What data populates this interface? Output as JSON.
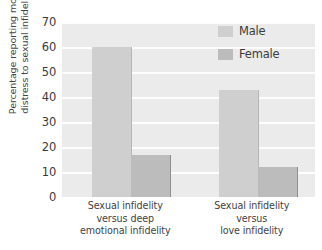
{
  "chart_data": {
    "type": "bar",
    "title": "",
    "xlabel": "",
    "ylabel": "Percentage reporting more\ndistress to sexual infidelity",
    "ylim": [
      0,
      70
    ],
    "ytick_step": 10,
    "yticks": [
      "70",
      "60",
      "50",
      "40",
      "30",
      "20",
      "10",
      "0"
    ],
    "grid": true,
    "grid_axis": "y",
    "legend_position": "top-right",
    "categories": [
      "Sexual infidelity\nversus deep\nemotional infidelity",
      "Sexual infidelity\nversus\nlove infidelity"
    ],
    "series": [
      {
        "name": "Male",
        "values": [
          60,
          43
        ],
        "color": "#cfcfcf"
      },
      {
        "name": "Female",
        "values": [
          17,
          12
        ],
        "color": "#bcbcbc"
      }
    ]
  },
  "legend": {
    "items": [
      {
        "label": "Male",
        "swatch": "male"
      },
      {
        "label": "Female",
        "swatch": "female"
      }
    ]
  },
  "colors": {
    "plot_background": "#ebebeb",
    "gridline": "#fdfdfd",
    "male_bar": "#cfcfcf",
    "female_bar": "#bcbcbc",
    "text": "#3b3b3b",
    "page_background": "#ffffff"
  }
}
